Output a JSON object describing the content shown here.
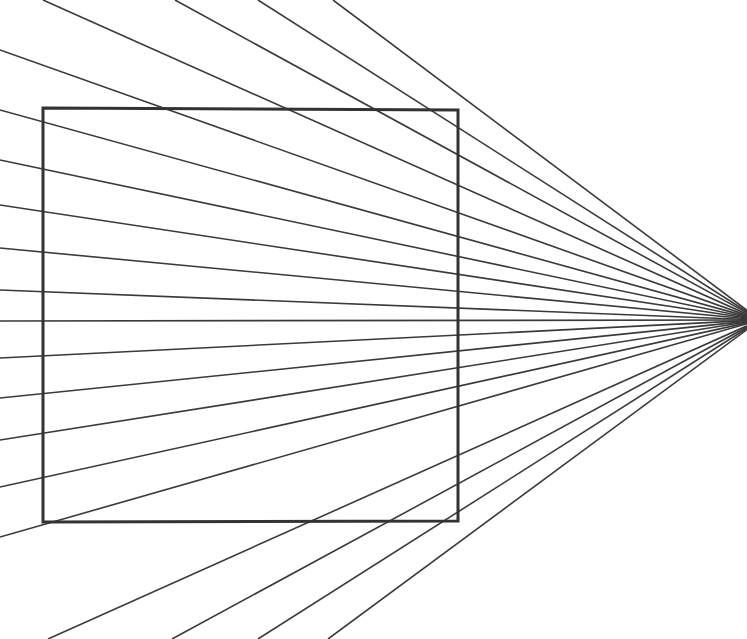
{
  "document": {
    "title": "Perspective Vanishing Point Line Drawing",
    "type": "line-drawing",
    "width": 747,
    "height": 639,
    "background_color": "#ffffff"
  },
  "figure": {
    "name": "one-point-perspective-radial-fan-with-square",
    "vanishing_point": {
      "x": 760,
      "y": 320
    },
    "ray_color": "#3a3a3a",
    "ray_width": 1.6,
    "ray_count": 19,
    "rays": [
      {
        "id": "ray-01",
        "from": {
          "x": 43,
          "y": 0
        },
        "label": "top-edge-ray-1"
      },
      {
        "id": "ray-02",
        "from": {
          "x": 175,
          "y": 0
        },
        "label": "top-edge-ray-2"
      },
      {
        "id": "ray-03",
        "from": {
          "x": 258,
          "y": 0
        },
        "label": "top-edge-ray-3"
      },
      {
        "id": "ray-04",
        "from": {
          "x": 333,
          "y": 0
        },
        "label": "top-edge-ray-4"
      },
      {
        "id": "ray-05",
        "from": {
          "x": 0,
          "y": 50
        },
        "label": "left-edge-ray-1"
      },
      {
        "id": "ray-06",
        "from": {
          "x": 0,
          "y": 110
        },
        "label": "left-edge-ray-2"
      },
      {
        "id": "ray-07",
        "from": {
          "x": 0,
          "y": 160
        },
        "label": "left-edge-ray-3"
      },
      {
        "id": "ray-08",
        "from": {
          "x": 0,
          "y": 205
        },
        "label": "left-edge-ray-4"
      },
      {
        "id": "ray-09",
        "from": {
          "x": 0,
          "y": 248
        },
        "label": "left-edge-ray-5"
      },
      {
        "id": "ray-10",
        "from": {
          "x": 0,
          "y": 290
        },
        "label": "left-edge-ray-6"
      },
      {
        "id": "ray-11",
        "from": {
          "x": 0,
          "y": 321
        },
        "label": "left-edge-horizon-ray"
      },
      {
        "id": "ray-12",
        "from": {
          "x": 0,
          "y": 358
        },
        "label": "left-edge-ray-7"
      },
      {
        "id": "ray-13",
        "from": {
          "x": 0,
          "y": 398
        },
        "label": "left-edge-ray-8"
      },
      {
        "id": "ray-14",
        "from": {
          "x": 0,
          "y": 440
        },
        "label": "left-edge-ray-9"
      },
      {
        "id": "ray-15",
        "from": {
          "x": 0,
          "y": 487
        },
        "label": "left-edge-ray-10"
      },
      {
        "id": "ray-16",
        "from": {
          "x": 0,
          "y": 537
        },
        "label": "left-edge-ray-11"
      },
      {
        "id": "ray-17",
        "from": {
          "x": 48,
          "y": 639
        },
        "label": "bottom-edge-ray-1"
      },
      {
        "id": "ray-18",
        "from": {
          "x": 172,
          "y": 639
        },
        "label": "bottom-edge-ray-2"
      },
      {
        "id": "ray-19",
        "from": {
          "x": 258,
          "y": 639
        },
        "label": "bottom-edge-ray-3"
      },
      {
        "id": "ray-20",
        "from": {
          "x": 328,
          "y": 639
        },
        "label": "bottom-edge-ray-4"
      }
    ],
    "square": {
      "label": "square-outline",
      "top_left": {
        "x": 43,
        "y": 108
      },
      "top_right": {
        "x": 458,
        "y": 110
      },
      "bottom_right": {
        "x": 458,
        "y": 521
      },
      "bottom_left": {
        "x": 43,
        "y": 522
      },
      "stroke_color": "#333333",
      "stroke_width": 3
    }
  }
}
